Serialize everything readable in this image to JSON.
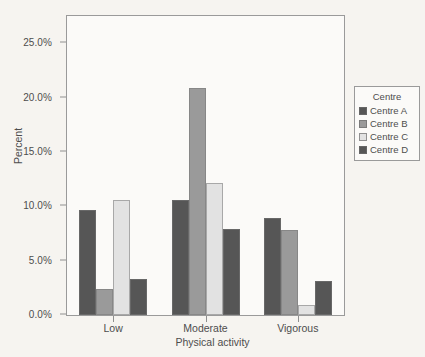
{
  "chart_data": {
    "type": "bar",
    "title": "",
    "xlabel": "Physical activity",
    "ylabel": "Percent",
    "categories": [
      "Low",
      "Moderate",
      "Vigorous"
    ],
    "ylim": [
      0,
      27.5
    ],
    "yticks": [
      "0.0%",
      "5.0%",
      "10.0%",
      "15.0%",
      "20.0%",
      "25.0%"
    ],
    "ytick_values": [
      0,
      5,
      10,
      15,
      20,
      25
    ],
    "grid": false,
    "legend_position": "right",
    "legend_title": "Centre",
    "series": [
      {
        "name": "Centre A",
        "color": "#565656",
        "values": [
          9.7,
          10.6,
          8.9
        ]
      },
      {
        "name": "Centre B",
        "color": "#9a9a9a",
        "values": [
          2.4,
          20.9,
          7.8
        ]
      },
      {
        "name": "Centre C",
        "color": "#e2e2e2",
        "values": [
          10.6,
          12.1,
          0.9
        ]
      },
      {
        "name": "Centre D",
        "color": "#565656",
        "values": [
          3.3,
          7.9,
          3.1
        ]
      }
    ]
  }
}
